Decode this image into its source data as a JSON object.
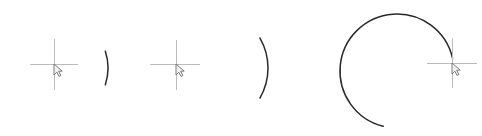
{
  "canvas": {
    "width": 482,
    "height": 136,
    "background_color": "#ffffff"
  },
  "style": {
    "arc_stroke_color": "#2a2a2a",
    "arc_stroke_width": 1.5,
    "crosshair_color": "#bcbcbc",
    "crosshair_stroke_width": 1,
    "cursor_outline_color": "#6e6e6e",
    "cursor_fill_color": "#f2f2f2"
  },
  "figures": [
    {
      "id": "figure-1",
      "label": "arc-270-degrees-open-right",
      "center": {
        "x": 54,
        "y": 68
      },
      "radius": 54,
      "start_angle_deg": 342,
      "end_angle_deg": 18,
      "sweep_deg": 36,
      "large_arc": true,
      "endpoint_top": {
        "x": 60,
        "y": 14
      },
      "endpoint_bottom": {
        "x": 60,
        "y": 122
      },
      "crosshair": {
        "x": 54,
        "y": 64,
        "arm_left": 30,
        "arm_right": 78,
        "arm_top": 39,
        "arm_bottom": 90
      }
    },
    {
      "id": "figure-2",
      "label": "arc-300-degrees-open-right",
      "center": {
        "x": 208,
        "y": 68
      },
      "radius": 60,
      "start_angle_deg": 330,
      "end_angle_deg": 30,
      "sweep_deg": 60,
      "large_arc": true,
      "endpoint_top": {
        "x": 238,
        "y": 11
      },
      "endpoint_bottom": {
        "x": 238,
        "y": 125
      },
      "crosshair": {
        "x": 176,
        "y": 64,
        "arm_left": 150,
        "arm_right": 200,
        "arm_top": 40,
        "arm_bottom": 90
      }
    },
    {
      "id": "figure-3",
      "label": "arc-340-degrees-near-full-circle",
      "center": {
        "x": 397,
        "y": 71
      },
      "radius": 57,
      "start_angle_deg": 104,
      "end_angle_deg": 347,
      "sweep_deg": 243,
      "large_arc": true,
      "endpoint_start": {
        "x": 383,
        "y": 127
      },
      "endpoint_end": {
        "x": 452,
        "y": 58
      },
      "crosshair": {
        "x": 452,
        "y": 63,
        "arm_left": 427,
        "arm_right": 477,
        "arm_top": 38,
        "arm_bottom": 88
      }
    }
  ]
}
